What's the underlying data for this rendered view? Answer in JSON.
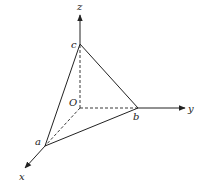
{
  "diagram": {
    "type": "3d-coordinate-tetrahedron",
    "axes": {
      "x": {
        "label": "x"
      },
      "y": {
        "label": "y"
      },
      "z": {
        "label": "z"
      }
    },
    "points": {
      "origin": {
        "label": "O"
      },
      "a": {
        "label": "a",
        "on_axis": "x"
      },
      "b": {
        "label": "b",
        "on_axis": "y"
      },
      "c": {
        "label": "c",
        "on_axis": "z"
      }
    },
    "solid_edges": [
      "a-b",
      "b-c",
      "c-a"
    ],
    "dashed_edges": [
      "O-a",
      "O-b",
      "O-c"
    ],
    "colors": {
      "line": "#222222",
      "background": "#ffffff"
    }
  }
}
